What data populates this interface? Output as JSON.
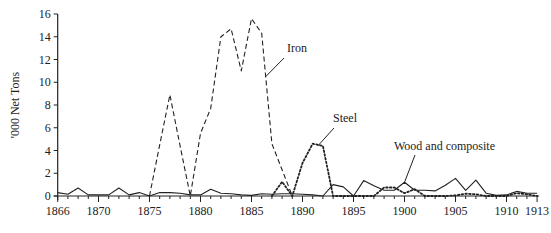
{
  "chart_data": {
    "type": "line",
    "title": "",
    "xlabel": "",
    "ylabel": "'000 Net Tons",
    "xlim": [
      1866,
      1913
    ],
    "ylim": [
      0,
      16
    ],
    "grid": false,
    "legend": "none (inline annotations)",
    "x_ticks": [
      1866,
      1870,
      1875,
      1880,
      1885,
      1890,
      1895,
      1900,
      1905,
      1910,
      1913
    ],
    "y_ticks": [
      0,
      2,
      4,
      6,
      8,
      10,
      12,
      14,
      16
    ],
    "series": [
      {
        "name": "Iron",
        "label": "Iron",
        "style": "dashed",
        "x": [
          1875,
          1876,
          1877,
          1878,
          1879,
          1880,
          1881,
          1882,
          1883,
          1884,
          1885,
          1886,
          1887,
          1888,
          1889
        ],
        "values": [
          0,
          4.5,
          8.9,
          4.4,
          0,
          5.5,
          7.7,
          14.0,
          14.7,
          11.0,
          15.6,
          14.3,
          4.6,
          2.3,
          0
        ]
      },
      {
        "name": "Steel",
        "label": "Steel",
        "style": "dotted",
        "x": [
          1887,
          1888,
          1889,
          1890,
          1891,
          1892,
          1893,
          1894,
          1895,
          1896,
          1897,
          1898,
          1899,
          1900,
          1901,
          1902,
          1903,
          1904,
          1905,
          1906,
          1907,
          1908,
          1909,
          1910,
          1911,
          1912,
          1913
        ],
        "values": [
          0,
          1.25,
          0,
          2.9,
          4.6,
          4.4,
          0,
          0,
          0,
          0,
          0,
          0.75,
          0.75,
          0.25,
          0.6,
          0,
          0,
          0,
          0.05,
          0.2,
          0.15,
          0,
          0,
          0,
          0.25,
          0.15,
          0
        ]
      },
      {
        "name": "Wood and composite",
        "label": "Wood and composite",
        "style": "solid",
        "x": [
          1866,
          1867,
          1868,
          1869,
          1870,
          1871,
          1872,
          1873,
          1874,
          1875,
          1876,
          1877,
          1878,
          1879,
          1880,
          1881,
          1882,
          1883,
          1884,
          1885,
          1886,
          1887,
          1888,
          1889,
          1890,
          1891,
          1892,
          1893,
          1894,
          1895,
          1896,
          1897,
          1898,
          1899,
          1900,
          1901,
          1902,
          1903,
          1904,
          1905,
          1906,
          1907,
          1908,
          1909,
          1910,
          1911,
          1912,
          1913
        ],
        "values": [
          0.3,
          0.15,
          0.7,
          0.1,
          0.1,
          0.1,
          0.7,
          0.1,
          0.3,
          0,
          0.3,
          0.3,
          0.25,
          0.1,
          0.1,
          0.6,
          0.25,
          0.2,
          0.1,
          0.05,
          0.2,
          0.15,
          0.2,
          0.2,
          0.15,
          0.1,
          0,
          1.0,
          0.8,
          0,
          1.35,
          0.9,
          0.5,
          0.5,
          1.2,
          0.5,
          0.5,
          0.45,
          0.95,
          1.55,
          0.5,
          1.4,
          0.25,
          0.05,
          0.1,
          0.4,
          0.25,
          0.25
        ]
      }
    ],
    "annotations": [
      {
        "text": "Iron",
        "series": "Iron",
        "anchor_year": 1886.4,
        "anchor_value": 10.5
      },
      {
        "text": "Steel",
        "series": "Steel",
        "anchor_year": 1891.5,
        "anchor_value": 4.4
      },
      {
        "text": "Wood and composite",
        "series": "Wood and composite",
        "anchor_year": 1900.0,
        "anchor_value": 1.2
      }
    ]
  }
}
